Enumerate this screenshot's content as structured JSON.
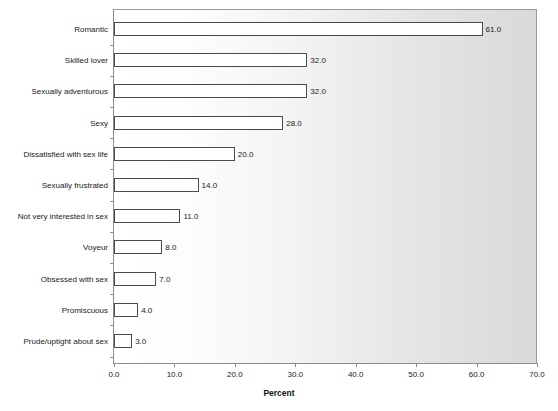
{
  "chart_data": {
    "type": "bar",
    "orientation": "horizontal",
    "title": "",
    "xlabel": "Percent",
    "ylabel": "",
    "xlim": [
      0.0,
      70.0
    ],
    "xticks": [
      "0.0",
      "10.0",
      "20.0",
      "30.0",
      "40.0",
      "50.0",
      "60.0",
      "70.0"
    ],
    "grid": false,
    "legend": null,
    "categories": [
      "Romantic",
      "Skilled lover",
      "Sexually adventurous",
      "Sexy",
      "Dissatisfied with sex life",
      "Sexually frustrated",
      "Not very interested in sex",
      "Voyeur",
      "Obsessed with sex",
      "Promiscuous",
      "Prude/uptight about sex"
    ],
    "values": [
      61.0,
      32.0,
      32.0,
      28.0,
      20.0,
      14.0,
      11.0,
      8.0,
      7.0,
      4.0,
      3.0
    ],
    "value_labels": [
      "61.0",
      "32.0",
      "32.0",
      "28.0",
      "20.0",
      "14.0",
      "11.0",
      "8.0",
      "7.0",
      "4.0",
      "3.0"
    ],
    "colors": {
      "bar_fill": "#ffffff",
      "bar_outline": "#4a4a4a",
      "axis": "#8c8c8c",
      "text": "#1a1a1a",
      "plot_background_left": "#ffffff",
      "plot_background_right": "#d9d9d9"
    }
  }
}
